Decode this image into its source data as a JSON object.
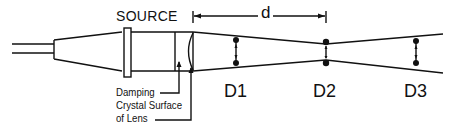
{
  "diagram": {
    "type": "beam-focusing-schematic",
    "labels": {
      "source": "SOURCE",
      "distance": "d",
      "damping": "Damping",
      "crystal_surface": "Crystal Surface",
      "of_lens": "of Lens"
    },
    "positions": [
      {
        "id": "D1",
        "label": "D1"
      },
      {
        "id": "D2",
        "label": "D2"
      },
      {
        "id": "D3",
        "label": "D3"
      }
    ],
    "colors": {
      "line": "#111111",
      "background": "#ffffff"
    }
  }
}
